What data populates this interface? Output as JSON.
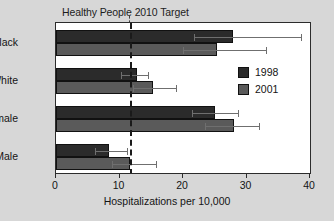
{
  "chart_data": {
    "type": "bar",
    "orientation": "horizontal",
    "title": "Healthy People 2010 Target",
    "xlabel": "Hospitalizations per 10,000",
    "ylabel": "",
    "xlim": [
      0,
      40
    ],
    "xticks": [
      0,
      10,
      20,
      30,
      40
    ],
    "xtick_labels": [
      "0",
      "10",
      "20",
      "30",
      "40"
    ],
    "grid": false,
    "legend_position": "center-right",
    "categories": [
      "Black",
      "White",
      "Female",
      "Male"
    ],
    "series": [
      {
        "name": "1998",
        "color": "#2b2b2b",
        "values": [
          27.8,
          12.7,
          25.1,
          8.4
        ],
        "error_high": [
          38.6,
          14.5,
          28.7,
          11.2
        ],
        "error_low": [
          21.8,
          10.3,
          21.4,
          6.2
        ]
      },
      {
        "name": "2001",
        "color": "#5a5a5a",
        "values": [
          25.4,
          15.2,
          28.1,
          11.6
        ],
        "error_high": [
          33.1,
          18.9,
          32.0,
          15.7
        ],
        "error_low": [
          20.0,
          12.2,
          23.5,
          8.8
        ]
      }
    ],
    "annotations": [
      {
        "name": "healthy-people-2010-target",
        "type": "vertical-dashed-line",
        "x_value": 11.6,
        "label": "Healthy People 2010 Target",
        "color": "#1a1a1a"
      }
    ]
  },
  "legend": {
    "entries": [
      {
        "label": "1998",
        "color": "#2b2b2b"
      },
      {
        "label": "2001",
        "color": "#5a5a5a"
      }
    ]
  },
  "colors": {
    "background": "#d7d7d7",
    "plot_background": "#ffffff",
    "axis": "#2c2c2c",
    "series_1998": "#2b2b2b",
    "series_2001": "#5a5a5a",
    "error_bar": "#6f6f6f"
  }
}
